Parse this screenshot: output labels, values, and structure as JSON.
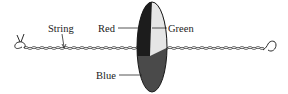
{
  "diagram": {
    "labels": {
      "string": "String",
      "red": "Red",
      "green": "Green",
      "blue": "Blue"
    },
    "colors": {
      "red_sector": "#1c1c1c",
      "green_sector": "#e6e6e6",
      "blue_sector": "#4a4a4a",
      "line": "#2a2a2a"
    }
  }
}
